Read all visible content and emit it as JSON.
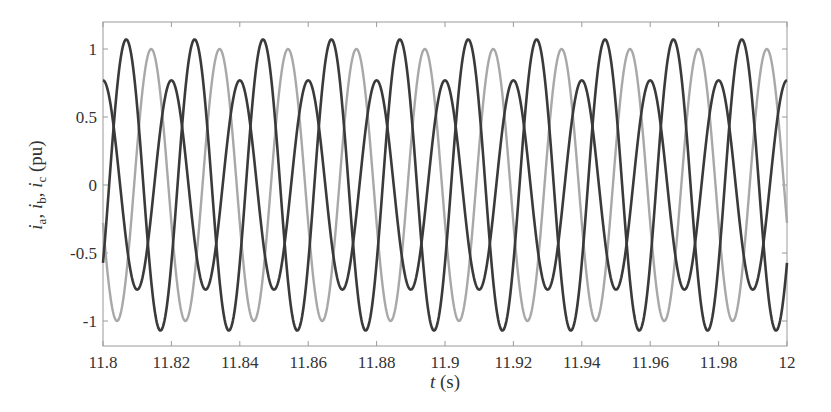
{
  "chart_data": {
    "type": "line",
    "title": "",
    "xlabel": "t (s)",
    "ylabel": "i_a, i_b, i_c (pu)",
    "xlim": [
      11.8,
      12.0
    ],
    "ylim": [
      -1.2,
      1.2
    ],
    "grid": false,
    "legend": null,
    "x_ticks": [
      11.8,
      11.82,
      11.84,
      11.86,
      11.88,
      11.9,
      11.92,
      11.94,
      11.96,
      11.98,
      12
    ],
    "x_tick_labels": [
      "11.8",
      "11.82",
      "11.84",
      "11.86",
      "11.88",
      "11.9",
      "11.92",
      "11.94",
      "11.96",
      "11.98",
      "12"
    ],
    "y_ticks": [
      -1,
      -0.5,
      0,
      0.5,
      1
    ],
    "y_tick_labels": [
      "-1",
      "-0.5",
      "0",
      "0.5",
      "1"
    ],
    "frequency_hz": 50,
    "series": [
      {
        "name": "i_a",
        "color": "#3a3a3a",
        "amplitude": 0.77,
        "peak_time": 11.8,
        "x": [
          11.8,
          11.805,
          11.81,
          11.815,
          11.82,
          11.9,
          12.0
        ],
        "values": [
          0.77,
          0.0,
          -0.77,
          0.0,
          0.77,
          0.77,
          0.77
        ]
      },
      {
        "name": "i_b",
        "color": "#3a3a3a",
        "amplitude": 1.07,
        "peak_time": 11.8068,
        "x": [
          11.8,
          11.8068,
          11.8168,
          11.8268,
          11.9868,
          12.0
        ],
        "values": [
          -0.53,
          1.07,
          -1.07,
          1.07,
          1.07,
          -0.53
        ]
      },
      {
        "name": "i_c",
        "color": "#a8a8a8",
        "amplitude": 1.0,
        "peak_time": 11.8141,
        "x": [
          11.8,
          11.8041,
          11.8141,
          11.9941,
          12.0
        ],
        "values": [
          -0.42,
          -1.0,
          1.0,
          1.0,
          -0.42
        ]
      }
    ]
  },
  "axes": {
    "x_label_italic": "t",
    "x_label_unit": " (s)",
    "y_label_parts": [
      "i",
      "a",
      ", ",
      "i",
      "b",
      ", ",
      "i",
      "c",
      " (pu)"
    ]
  }
}
